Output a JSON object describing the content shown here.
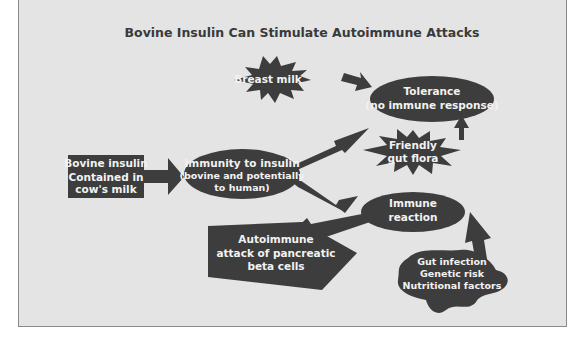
{
  "diagram": {
    "title": "Bovine Insulin Can Stimulate Autoimmune Attacks",
    "colors": {
      "background": "#e4e4e4",
      "border": "#8a8a8a",
      "shape_fill": "#3d3d3d",
      "shape_text": "#f2f2f2",
      "title_text": "#3a3a3a"
    },
    "nodes": {
      "bovine_insulin": {
        "shape": "rectangle",
        "lines": [
          "Bovine insulin",
          "Contained in",
          "cow's milk"
        ]
      },
      "immunity": {
        "shape": "ellipse",
        "lines": [
          "Immunity to insulin",
          "(bovine and potentially",
          "to human)"
        ]
      },
      "breast_milk": {
        "shape": "starburst",
        "lines": [
          "Breast milk"
        ]
      },
      "tolerance": {
        "shape": "ellipse",
        "lines": [
          "Tolerance",
          "(no immune response)"
        ]
      },
      "gut_flora": {
        "shape": "starburst",
        "lines": [
          "Friendly",
          "gut flora"
        ]
      },
      "immune_reaction": {
        "shape": "ellipse",
        "lines": [
          "Immune",
          "reaction"
        ]
      },
      "autoimmune_attack": {
        "shape": "pentagon",
        "lines": [
          "Autoimmune",
          "attack of pancreatic",
          "beta cells"
        ]
      },
      "risk_factors": {
        "shape": "blob",
        "lines": [
          "Gut infection",
          "Genetic risk",
          "Nutritional factors"
        ]
      }
    },
    "edges": [
      {
        "from": "bovine_insulin",
        "to": "immunity"
      },
      {
        "from": "breast_milk",
        "to": "tolerance"
      },
      {
        "from": "immunity",
        "to": "tolerance"
      },
      {
        "from": "gut_flora",
        "to": "tolerance"
      },
      {
        "from": "immunity",
        "to": "immune_reaction"
      },
      {
        "from": "immune_reaction",
        "to": "autoimmune_attack"
      },
      {
        "from": "risk_factors",
        "to": "immune_reaction"
      }
    ]
  }
}
